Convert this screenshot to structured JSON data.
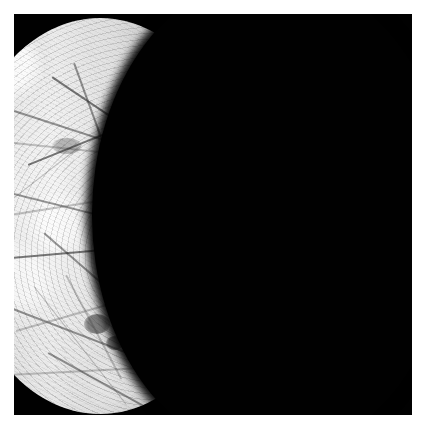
{
  "image": {
    "subject": "Europa",
    "subject_type": "icy moon",
    "phase": "crescent",
    "alt_text": "Black-and-white spacecraft photograph of the icy moon Europa lit as a thin-to-half crescent on the left side of the frame against black space, its bright ice surface crosshatched with dark linear cracks",
    "orientation": "crescent opens to the left; terminator runs down the middle",
    "border": {
      "present": true,
      "color": "#ffffff",
      "width_px": 14
    },
    "background_color": "#010101",
    "surface_colors": {
      "highlight": "#efefef",
      "midtone": "#c6c6c6",
      "limb_shadow": "#4a4a4a",
      "linea_dark": "#383838"
    },
    "geometry": {
      "north_horn_tip": "180, 22",
      "south_horn_tip": "240, 415",
      "terminator_max_x": "165",
      "limb_leftmost_x": "14"
    },
    "features": [
      "bright icy crust",
      "dark crisscrossing lineae (fractures)",
      "mottled chaos terrain",
      "dark blotch south of center",
      "smooth limb-darkened western edge",
      "ragged terminator along the day/night boundary"
    ],
    "caption": "Europa — crescent phase"
  }
}
